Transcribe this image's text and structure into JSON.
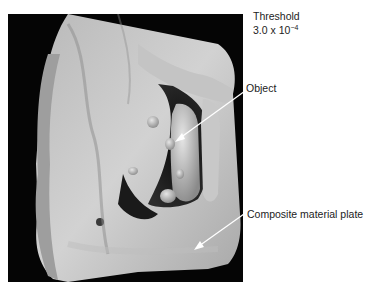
{
  "figure": {
    "threshold": {
      "title": "Threshold",
      "value_mantissa": "3.0 x 10",
      "value_exponent": "−4"
    },
    "annotations": [
      {
        "label": "Object",
        "target": "object-in-plate"
      },
      {
        "label": "Composite material plate",
        "target": "plate-surface"
      }
    ],
    "colors": {
      "background": "#ffffff",
      "render_background": "#050505",
      "surface_light": "#cfcfcf",
      "surface_mid": "#9a9a9a",
      "surface_dark": "#5a5a5a",
      "arrow": "#ffffff"
    }
  }
}
